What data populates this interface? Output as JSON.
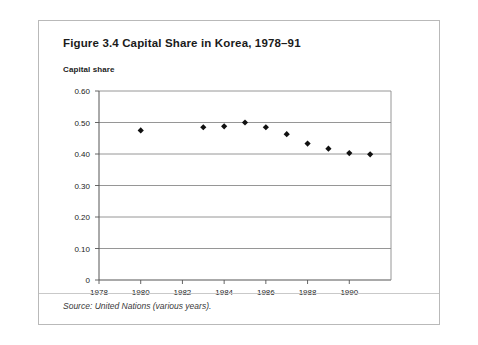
{
  "figure": {
    "title": "Figure 3.4 Capital Share in Korea, 1978–91",
    "axis_title": "Capital share",
    "source": "Source: United Nations (various years)."
  },
  "chart_data": {
    "type": "scatter",
    "title": "Figure 3.4 Capital Share in Korea, 1978–91",
    "xlabel": "",
    "ylabel": "Capital share",
    "xlim": [
      1978,
      1992
    ],
    "ylim": [
      0,
      0.6
    ],
    "grid": true,
    "legend": null,
    "marker": "diamond",
    "marker_color": "#111111",
    "xticks": [
      1978,
      1980,
      1982,
      1984,
      1986,
      1988,
      1990
    ],
    "xtick_labels": [
      "1978",
      "1980",
      "1982",
      "1984",
      "1986",
      "1988",
      "1990"
    ],
    "yticks": [
      0,
      0.1,
      0.2,
      0.3,
      0.4,
      0.5,
      0.6
    ],
    "ytick_labels": [
      "0",
      "0.10",
      "0.20",
      "0.30",
      "0.40",
      "0.50",
      "0.60"
    ],
    "x": [
      1980,
      1983,
      1984,
      1985,
      1986,
      1987,
      1988,
      1989,
      1990,
      1991
    ],
    "values": [
      0.475,
      0.485,
      0.488,
      0.5,
      0.485,
      0.463,
      0.433,
      0.417,
      0.403,
      0.399
    ],
    "points": [
      {
        "year": 1980,
        "value": 0.475
      },
      {
        "year": 1983,
        "value": 0.485
      },
      {
        "year": 1984,
        "value": 0.488
      },
      {
        "year": 1985,
        "value": 0.5
      },
      {
        "year": 1986,
        "value": 0.485
      },
      {
        "year": 1987,
        "value": 0.463
      },
      {
        "year": 1988,
        "value": 0.433
      },
      {
        "year": 1989,
        "value": 0.417
      },
      {
        "year": 1990,
        "value": 0.403
      },
      {
        "year": 1991,
        "value": 0.399
      }
    ]
  },
  "colors": {
    "card_border": "#b9b9b9",
    "gridline": "#8a8a8a",
    "axis": "#555555",
    "text": "#1b1b1b",
    "marker": "#111111"
  }
}
